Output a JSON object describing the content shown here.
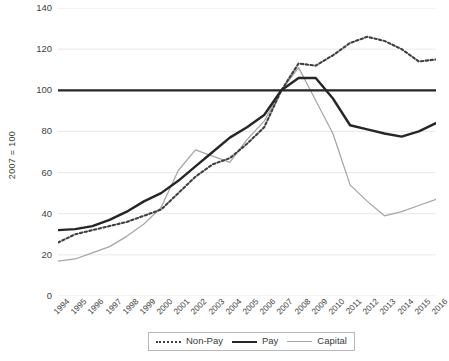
{
  "chart_data": {
    "type": "line",
    "title": "",
    "xlabel": "",
    "ylabel": "2007 = 100",
    "ylim": [
      0,
      140
    ],
    "ytick_values": [
      0,
      20,
      40,
      60,
      80,
      100,
      120,
      140
    ],
    "grid": "horizontal",
    "legend_position": "bottom",
    "categories": [
      "1994",
      "1995",
      "1996",
      "1997",
      "1998",
      "1999",
      "2000",
      "2001",
      "2002",
      "2003",
      "2004",
      "2005",
      "2006",
      "2007",
      "2008",
      "2009",
      "2010",
      "2011",
      "2012",
      "2013",
      "2014",
      "2015",
      "2016"
    ],
    "series": [
      {
        "name": "Non-Pay",
        "style": "dotted",
        "color": "#404040",
        "values": [
          26,
          30,
          32,
          34,
          36,
          39,
          42,
          50,
          58,
          64,
          67,
          74,
          82,
          100,
          113,
          112,
          117,
          123,
          126,
          124,
          120,
          114,
          115
        ]
      },
      {
        "name": "Pay",
        "style": "solid-thick",
        "color": "#262626",
        "values": [
          32,
          32.5,
          34,
          37,
          41,
          46,
          50,
          56,
          63,
          70,
          77,
          82,
          88,
          100,
          106,
          106,
          96,
          83,
          81,
          79,
          77.5,
          80,
          84
        ]
      },
      {
        "name": "Capital",
        "style": "solid-thin",
        "color": "#a6a6a6",
        "values": [
          17,
          18,
          21,
          24,
          29,
          35,
          43,
          61,
          71,
          68,
          65,
          76,
          85,
          100,
          111,
          95,
          79,
          54,
          46,
          39,
          41,
          44,
          47
        ]
      }
    ]
  },
  "reference_line": {
    "name": "index-baseline",
    "value": 100,
    "color": "#262626"
  },
  "legend": {
    "items": [
      {
        "label": "Non-Pay",
        "swatch": "dotted-line-swatch"
      },
      {
        "label": "Pay",
        "swatch": "thick-solid-line-swatch"
      },
      {
        "label": "Capital",
        "swatch": "thin-solid-line-swatch"
      }
    ]
  }
}
